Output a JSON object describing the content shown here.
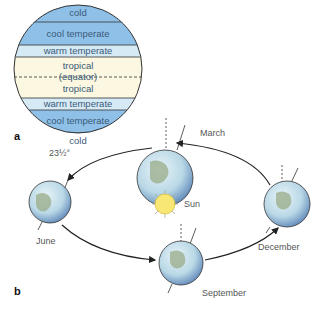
{
  "panel_a": {
    "label": "a",
    "zones": [
      {
        "name": "cold",
        "label": "cold",
        "color": "#8fc1e8"
      },
      {
        "name": "cool-temperate",
        "label": "cool temperate",
        "color": "#8fc1e8"
      },
      {
        "name": "warm-temperate",
        "label": "warm temperate",
        "color": "#d6eaf6"
      },
      {
        "name": "tropical-north",
        "label": "tropical",
        "color": "#fbf7e0"
      },
      {
        "name": "equator",
        "label": "(equator)"
      },
      {
        "name": "tropical-south",
        "label": "tropical",
        "color": "#fbf7e0"
      },
      {
        "name": "warm-temperate-south",
        "label": "warm temperate",
        "color": "#d6eaf6"
      },
      {
        "name": "cool-temperate-south",
        "label": "cool temperate",
        "color": "#8fc1e8"
      },
      {
        "name": "cold-south",
        "label": "cold",
        "color": "#8fc1e8"
      }
    ]
  },
  "panel_b": {
    "label": "b",
    "tilt_label": "23½°",
    "sun_label": "Sun",
    "months": {
      "march": "March",
      "june": "June",
      "september": "September",
      "december": "December"
    }
  }
}
